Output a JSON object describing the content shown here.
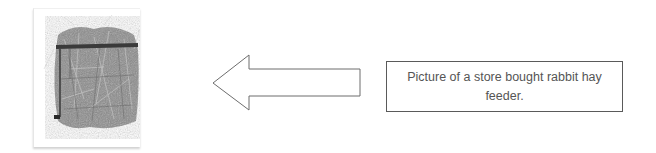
{
  "figure": {
    "image": {
      "subject": "store-bought rabbit hay feeder filled with hay",
      "icon": "hay-feeder-photo"
    },
    "arrow": {
      "direction": "left",
      "icon": "left-arrow-outline"
    },
    "caption": {
      "text": "Picture of a store bought rabbit hay feeder."
    }
  }
}
